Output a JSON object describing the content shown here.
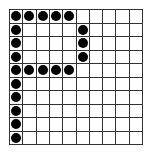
{
  "grid": {
    "rows": 10,
    "cols": 10,
    "line_color": "#333333",
    "dot_color": "#000000",
    "filled_cells": [
      [
        0,
        0
      ],
      [
        0,
        1
      ],
      [
        0,
        2
      ],
      [
        0,
        3
      ],
      [
        0,
        4
      ],
      [
        1,
        0
      ],
      [
        1,
        5
      ],
      [
        2,
        0
      ],
      [
        2,
        5
      ],
      [
        3,
        0
      ],
      [
        3,
        5
      ],
      [
        4,
        0
      ],
      [
        4,
        1
      ],
      [
        4,
        2
      ],
      [
        4,
        3
      ],
      [
        4,
        4
      ],
      [
        5,
        0
      ],
      [
        6,
        0
      ],
      [
        7,
        0
      ],
      [
        8,
        0
      ],
      [
        9,
        0
      ]
    ]
  }
}
